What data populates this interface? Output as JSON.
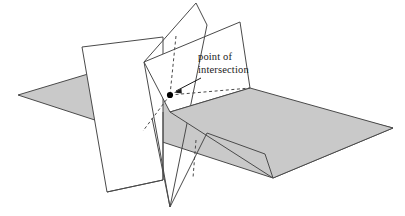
{
  "figure": {
    "background_color": "#ffffff",
    "stroke_color": "#4a4a4a",
    "shaded_plane_fill": "#c9c9c9",
    "white_plane_fill": "#ffffff",
    "marker_color": "#000000",
    "text_color": "#1a1a1a"
  },
  "annotation": {
    "line1": "point of",
    "line2": "intersection",
    "arrow_from": [
      201,
      78
    ],
    "arrow_to": [
      172,
      93
    ]
  },
  "planes": {
    "horizontal": {
      "name": "shaded-horizontal-plane",
      "fill": "#c9c9c9",
      "points": "18,95 128,62 393,128 273,178"
    },
    "left_vertical": {
      "name": "left-vertical-plane",
      "fill": "#ffffff",
      "points": "82,47 163,37 163,180 107,192"
    },
    "middle_vertical": {
      "name": "middle-vertical-plane",
      "fill": "#ffffff",
      "points": "196,3 144,62 170,207 207,25"
    },
    "right_vertical": {
      "name": "right-vertical-plane",
      "fill": "#ffffff",
      "points": "144,62 240,22 250,88 170,112"
    }
  },
  "marker": {
    "name": "intersection-point",
    "cx": 170,
    "cy": 95,
    "r": 3.1
  },
  "dashed_segments": [
    {
      "name": "dashed-vertical-upper",
      "x1": 176,
      "y1": 36,
      "x2": 170,
      "y2": 95
    },
    {
      "name": "dashed-down-left",
      "x1": 170,
      "y1": 95,
      "x2": 143,
      "y2": 131
    },
    {
      "name": "dashed-to-right-corner",
      "x1": 170,
      "y1": 95,
      "x2": 250,
      "y2": 88
    },
    {
      "name": "dashed-vertical-lower",
      "x1": 196,
      "y1": 140,
      "x2": 193,
      "y2": 178
    }
  ]
}
